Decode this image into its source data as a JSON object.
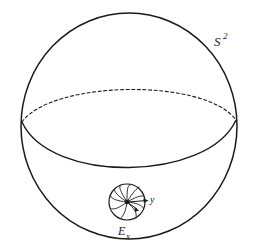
{
  "figure": {
    "title_label": "S",
    "title_exponent": "2",
    "field_label": "E",
    "field_subscript": "x",
    "axis_label_y": "y",
    "background_color": "#ffffff",
    "ink_color": "#1a1a1a"
  },
  "geometry": {
    "sphere": {
      "center_x": 129,
      "center_y": 126,
      "radius_x": 108,
      "radius_y": 113
    },
    "equator": {
      "left_x": 22,
      "left_y": 122,
      "right_x": 236,
      "right_y": 120,
      "front_sag": 58,
      "back_rise": 48
    },
    "disc": {
      "center_x": 127,
      "center_y": 202,
      "radius": 18,
      "petal_count": 9
    },
    "labels": {
      "sphere_label_x": 214,
      "sphere_label_y": 44,
      "field_label_x": 118,
      "field_label_y": 235,
      "axis_label_x": 151,
      "axis_label_y": 203
    }
  }
}
